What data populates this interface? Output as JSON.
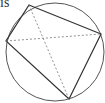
{
  "caption_fragment": "is",
  "diagram": {
    "type": "cyclic-quadrilateral",
    "circle": {
      "cx": 55,
      "cy": 52,
      "r": 49
    },
    "vertices": [
      {
        "name": "top",
        "x": 29,
        "y": 5
      },
      {
        "name": "right",
        "x": 101,
        "y": 34
      },
      {
        "name": "bottom",
        "x": 69,
        "y": 99
      },
      {
        "name": "left",
        "x": 6,
        "y": 41
      }
    ],
    "diagonals_style": "dashed",
    "stroke_color": "#333333"
  }
}
